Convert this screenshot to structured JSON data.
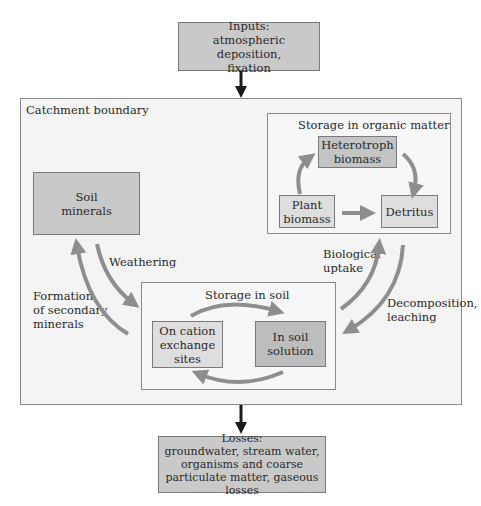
{
  "colors": {
    "background": "#ffffff",
    "catchment_fill": "#f4f4f4",
    "inner_frame_fill": "#f7f7f7",
    "box_medium": "#c9c9c9",
    "box_light": "#dedede",
    "box_dark": "#bdbdbd",
    "arrow_gray": "#8e8e8e",
    "arrow_black": "#1a1a1a"
  },
  "inputs": {
    "line1": "Inputs:",
    "line2": "atmospheric deposition,",
    "line3": "fixation"
  },
  "catchment": {
    "label": "Catchment boundary"
  },
  "organic_storage": {
    "title": "Storage in organic matter",
    "heterotroph": {
      "line1": "Heterotroph",
      "line2": "biomass"
    },
    "plant": {
      "line1": "Plant",
      "line2": "biomass"
    },
    "detritus": {
      "label": "Detritus"
    }
  },
  "soil_minerals": {
    "line1": "Soil",
    "line2": "minerals"
  },
  "soil_storage": {
    "title": "Storage in soil",
    "cation": {
      "line1": "On cation",
      "line2": "exchange",
      "line3": "sites"
    },
    "solution": {
      "line1": "In soil",
      "line2": "solution"
    }
  },
  "flows": {
    "weathering": "Weathering",
    "secondary": {
      "line1": "Formation",
      "line2": "of secondary",
      "line3": "minerals"
    },
    "uptake": {
      "line1": "Biological",
      "line2": "uptake"
    },
    "decomposition": {
      "line1": "Decomposition,",
      "line2": "leaching"
    }
  },
  "losses": {
    "line1": "Losses:",
    "line2": "groundwater, stream water,",
    "line3": "organisms and coarse",
    "line4": "particulate matter, gaseous losses"
  }
}
